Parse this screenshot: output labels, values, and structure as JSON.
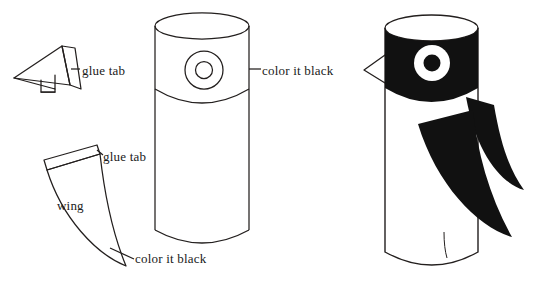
{
  "figure": {
    "stroke_color": "#231f1e",
    "fill_black": "#111111",
    "background": "#ffffff",
    "width": 536,
    "height": 286
  },
  "labels": {
    "beak_glue_tab": "glue tab",
    "body_color_it_black": "color it black",
    "wing_glue_tab": "glue tab",
    "wing_name": "wing",
    "wing_color_it_black": "color it black"
  },
  "parts": {
    "beak": {
      "name": "beak",
      "description": "triangular beak pattern with glue tab"
    },
    "body": {
      "name": "body-cylinder",
      "description": "cylinder tube with eye circle and head band"
    },
    "wing": {
      "name": "wing",
      "description": "curved wing pattern with glue tab strip"
    },
    "assembled": {
      "name": "assembled-owl",
      "description": "finished owl with black head band, eye, beak and two wings"
    }
  }
}
